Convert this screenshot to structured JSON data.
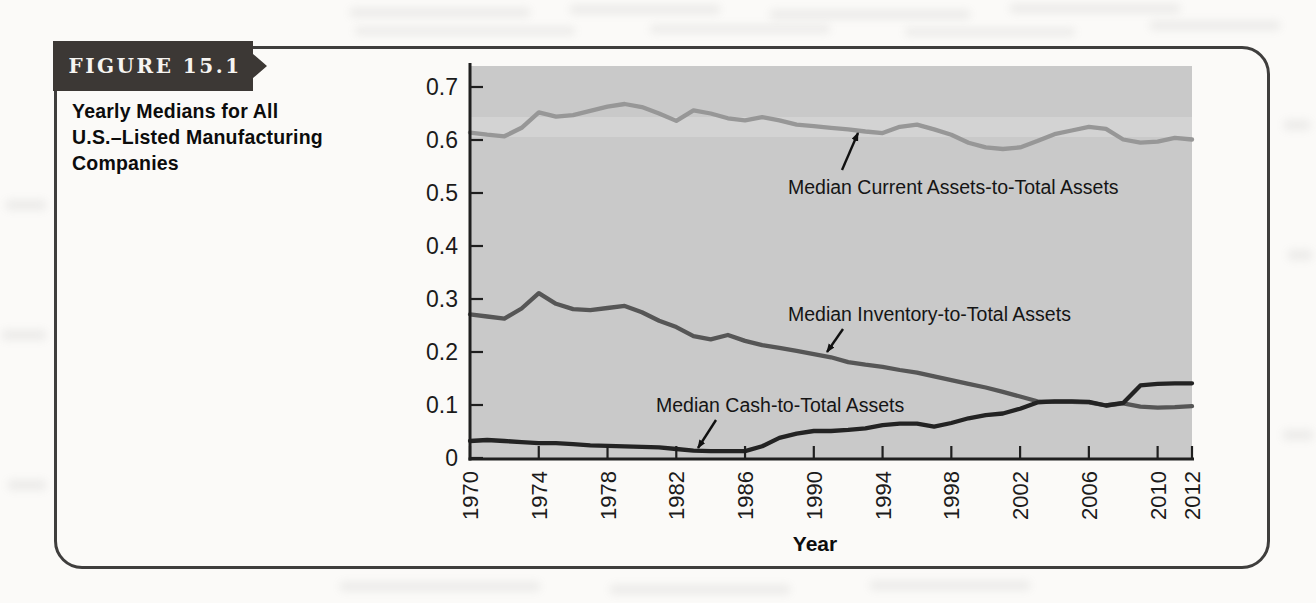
{
  "figure": {
    "badge_label": "FIGURE 15.1",
    "caption_lines": [
      "Yearly Medians for All",
      "U.S.–Listed Manufacturing",
      "Companies"
    ]
  },
  "chart_data": {
    "type": "line",
    "title": "",
    "xlabel": "Year",
    "ylabel": "",
    "grid": false,
    "legend_position": "inline-annotations",
    "plot_bg_color": "#c9c9c9",
    "axis_color": "#1f1f1f",
    "xlim": [
      1970,
      2012
    ],
    "ylim": [
      0,
      0.736
    ],
    "xtick_years": [
      1970,
      1974,
      1978,
      1982,
      1986,
      1990,
      1994,
      1998,
      2002,
      2006,
      2010,
      2012
    ],
    "ytick_values": [
      0,
      0.1,
      0.2,
      0.3,
      0.4,
      0.5,
      0.6,
      0.7
    ],
    "ytick_labels": [
      "0",
      "0.1",
      "0.2",
      "0.3",
      "0.4",
      "0.5",
      "0.6",
      "0.7"
    ],
    "years": [
      1970,
      1971,
      1972,
      1973,
      1974,
      1975,
      1976,
      1977,
      1978,
      1979,
      1980,
      1981,
      1982,
      1983,
      1984,
      1985,
      1986,
      1987,
      1988,
      1989,
      1990,
      1991,
      1992,
      1993,
      1994,
      1995,
      1996,
      1997,
      1998,
      1999,
      2000,
      2001,
      2002,
      2003,
      2004,
      2005,
      2006,
      2007,
      2008,
      2009,
      2010,
      2011,
      2012
    ],
    "series": [
      {
        "name": "Median Current Assets-to-Total Assets",
        "color": "#979797",
        "values": [
          0.614,
          0.61,
          0.607,
          0.623,
          0.652,
          0.644,
          0.647,
          0.655,
          0.663,
          0.668,
          0.662,
          0.65,
          0.636,
          0.656,
          0.65,
          0.641,
          0.637,
          0.643,
          0.637,
          0.629,
          0.626,
          0.623,
          0.62,
          0.616,
          0.613,
          0.625,
          0.629,
          0.62,
          0.61,
          0.595,
          0.586,
          0.583,
          0.586,
          0.598,
          0.611,
          0.618,
          0.625,
          0.621,
          0.601,
          0.595,
          0.597,
          0.604,
          0.601
        ]
      },
      {
        "name": "Median Inventory-to-Total Assets",
        "color": "#565656",
        "values": [
          0.271,
          0.267,
          0.263,
          0.282,
          0.311,
          0.291,
          0.281,
          0.279,
          0.283,
          0.287,
          0.275,
          0.259,
          0.247,
          0.23,
          0.224,
          0.232,
          0.221,
          0.213,
          0.208,
          0.202,
          0.196,
          0.19,
          0.181,
          0.176,
          0.172,
          0.166,
          0.161,
          0.154,
          0.147,
          0.14,
          0.133,
          0.125,
          0.116,
          0.107,
          0.106,
          0.106,
          0.105,
          0.099,
          0.103,
          0.097,
          0.095,
          0.096,
          0.098
        ]
      },
      {
        "name": "Median Cash-to-Total Assets",
        "color": "#232323",
        "values": [
          0.032,
          0.034,
          0.032,
          0.03,
          0.028,
          0.028,
          0.026,
          0.024,
          0.023,
          0.022,
          0.021,
          0.02,
          0.017,
          0.014,
          0.013,
          0.013,
          0.013,
          0.022,
          0.038,
          0.046,
          0.051,
          0.051,
          0.053,
          0.056,
          0.062,
          0.065,
          0.065,
          0.059,
          0.066,
          0.075,
          0.081,
          0.084,
          0.093,
          0.105,
          0.107,
          0.107,
          0.106,
          0.099,
          0.104,
          0.137,
          0.14,
          0.141,
          0.141
        ]
      }
    ],
    "annotations": [
      {
        "text": "Median Current Assets-to-Total Assets",
        "text_x": 788,
        "text_y": 194,
        "arrow_from": [
          842,
          170
        ],
        "arrow_to": [
          858,
          133
        ]
      },
      {
        "text": "Median Inventory-to-Total Assets",
        "text_x": 788,
        "text_y": 321,
        "arrow_from": [
          843,
          329
        ],
        "arrow_to": [
          827,
          352
        ]
      },
      {
        "text": "Median Cash-to-Total Assets",
        "text_x": 656,
        "text_y": 412,
        "arrow_from": [
          716,
          420
        ],
        "arrow_to": [
          698,
          448
        ]
      }
    ]
  }
}
